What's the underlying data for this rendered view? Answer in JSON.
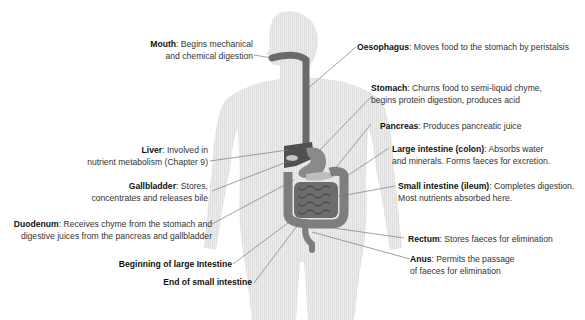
{
  "colors": {
    "body": "#e6e6e6",
    "organ_dark": "#555555",
    "organ_mid": "#7a7a7a",
    "organ_light": "#b5b5b5",
    "leader_line": "#777777",
    "text": "#333333"
  },
  "labels": {
    "mouth": {
      "term": "Mouth",
      "desc1": ": Begins mechanical",
      "desc2": "and chemical digestion"
    },
    "oesophagus": {
      "term": "Oesophagus",
      "desc1": ": Moves food to the stomach by peristalsis"
    },
    "stomach": {
      "term": "Stomach",
      "desc1": ": Churns food to semi-liquid chyme,",
      "desc2": "begins protein digestion, produces acid"
    },
    "pancreas": {
      "term": "Pancreas",
      "desc1": ": Produces pancreatic juice"
    },
    "large_intestine": {
      "term": "Large intestine (colon)",
      "desc1": ": Absorbs water",
      "desc2": "and minerals. Forms faeces for excretion."
    },
    "small_intestine": {
      "term": "Small intestine (ileum)",
      "desc1": ": Completes digestion.",
      "desc2": "Most nutrients absorbed here."
    },
    "rectum": {
      "term": "Rectum",
      "desc1": ": Stores faeces for elimination"
    },
    "anus": {
      "term": "Anus",
      "desc1": ": Permits the passage",
      "desc2": "of faeces for elimination"
    },
    "liver": {
      "term": "Liver",
      "desc1": ": Involved in",
      "desc2": "nutrient metabolism (Chapter 9)"
    },
    "gallbladder": {
      "term": "Gallbladder",
      "desc1": ": Stores,",
      "desc2": "concentrates and releases bile"
    },
    "duodenum": {
      "term": "Duodenum",
      "desc1": ": Receives chyme from the stomach and",
      "desc2": "digestive juices from the pancreas and gallbladder"
    },
    "beginning_large": {
      "term": "Beginning of large Intestine"
    },
    "end_small": {
      "term": "End of small intestine"
    }
  }
}
